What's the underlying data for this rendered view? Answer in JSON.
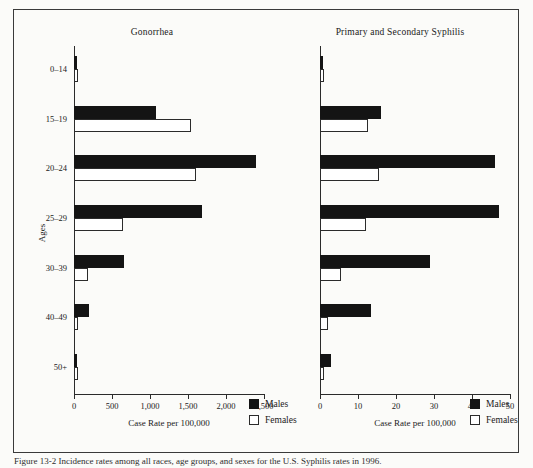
{
  "figure": {
    "caption": "Figure 13-2  Incidence rates among all races, age groups, and sexes for the U.S. Syphilis rates in 1996."
  },
  "legend": {
    "males_label": "Males",
    "females_label": "Females",
    "male_color": "#141414",
    "female_color": "#ffffff"
  },
  "axes": {
    "y_title": "Ages",
    "categories": [
      "0–14",
      "15–19",
      "20–24",
      "25–29",
      "30–39",
      "40–49",
      "50+"
    ]
  },
  "chart_data": [
    {
      "type": "bar",
      "title": "Gonorrhea",
      "xlabel": "Case Rate per 100,000",
      "ylabel": "Ages",
      "orientation": "horizontal",
      "categories": [
        "0–14",
        "15–19",
        "20–24",
        "25–29",
        "30–39",
        "40–49",
        "50+"
      ],
      "xlim": [
        0,
        2500
      ],
      "xticks": [
        0,
        500,
        1000,
        1500,
        2000,
        2500
      ],
      "xtick_labels": [
        "0",
        "500",
        "1,000",
        "1,500",
        "2,000",
        "2,500"
      ],
      "grid": false,
      "legend_position": "bottom-right",
      "series": [
        {
          "name": "Males",
          "values": [
            30,
            1080,
            2400,
            1680,
            660,
            200,
            40
          ]
        },
        {
          "name": "Females",
          "values": [
            45,
            1540,
            1600,
            650,
            190,
            50,
            10
          ]
        }
      ]
    },
    {
      "type": "bar",
      "title": "Primary and Secondary Syphilis",
      "xlabel": "Case Rate per 100,000",
      "ylabel": "Ages",
      "orientation": "horizontal",
      "categories": [
        "0–14",
        "15–19",
        "20–24",
        "25–29",
        "30–39",
        "40–49",
        "50+"
      ],
      "xlim": [
        0,
        50
      ],
      "xticks": [
        0,
        10,
        20,
        30,
        40,
        50
      ],
      "xtick_labels": [
        "0",
        "10",
        "20",
        "30",
        "40",
        "50"
      ],
      "grid": false,
      "legend_position": "bottom-right",
      "series": [
        {
          "name": "Males",
          "values": [
            0.3,
            16,
            46,
            47,
            29,
            13.5,
            3
          ]
        },
        {
          "name": "Females",
          "values": [
            0.7,
            12.5,
            15.5,
            12,
            5.5,
            2,
            0.8
          ]
        }
      ]
    }
  ]
}
